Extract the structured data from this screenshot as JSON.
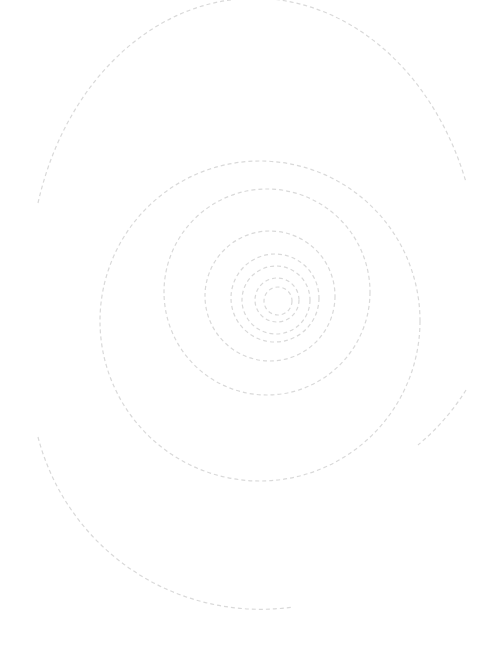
{
  "graphic": {
    "name": "dashed-spiral",
    "background": "#ffffff",
    "stroke_color": "#d9d9d9",
    "stroke_width": 1.2,
    "dash": "4 3",
    "rings": [
      {
        "cx": 278,
        "cy": 301,
        "r": 14
      },
      {
        "cx": 277,
        "cy": 300,
        "r": 22
      },
      {
        "cx": 276,
        "cy": 300,
        "r": 34
      },
      {
        "cx": 275,
        "cy": 298,
        "r": 44
      },
      {
        "cx": 270,
        "cy": 296,
        "r": 65
      },
      {
        "cx": 267,
        "cy": 292,
        "r": 103
      },
      {
        "cx": 260,
        "cy": 321,
        "r": 160
      }
    ],
    "outer_arcs": [
      {
        "d": "M 38 203 A 225 280 0 0 1 466 182"
      },
      {
        "d": "M 38 437 A 230 230 0 0 0 293 607"
      },
      {
        "d": "M 466 390 A 230 230 0 0 1 418 445"
      }
    ]
  }
}
